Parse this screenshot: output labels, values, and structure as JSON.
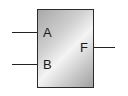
{
  "diagram": {
    "type": "logic-block",
    "inputs": [
      {
        "label": "A"
      },
      {
        "label": "B"
      }
    ],
    "output": {
      "label": "F"
    }
  }
}
